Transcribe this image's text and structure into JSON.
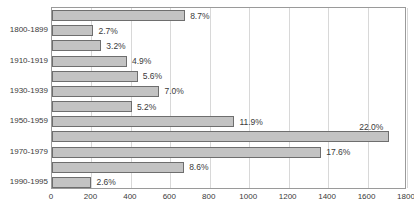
{
  "chart_data": {
    "type": "bar",
    "orientation": "horizontal",
    "title": "",
    "xlabel": "",
    "ylabel": "",
    "xlim": [
      0,
      1800
    ],
    "xticks": [
      0,
      200,
      400,
      600,
      800,
      1000,
      1200,
      1400,
      1600,
      1800
    ],
    "grid": true,
    "legend": null,
    "colors": {
      "bar_fill": "#c3c3c3",
      "bar_border": "#6e6e6e",
      "gridline": "#d8d8d8",
      "frame": "#9a9a9a",
      "text": "#3a3a3a"
    },
    "categories": [
      "",
      "1800-1899",
      "",
      "1910-1919",
      "",
      "1930-1939",
      "",
      "1950-1959",
      "",
      "1970-1979",
      "",
      "1990-1995"
    ],
    "category_labels": [
      "1800-1899",
      "1910-1919",
      "1930-1939",
      "1950-1959",
      "1970-1979",
      "1990-1995"
    ],
    "bars": [
      {
        "value": 675,
        "label": "8.7%",
        "label_position": "right"
      },
      {
        "value": 210,
        "label": "2.7%",
        "label_position": "right"
      },
      {
        "value": 250,
        "label": "3.2%",
        "label_position": "right"
      },
      {
        "value": 380,
        "label": "4.9%",
        "label_position": "right"
      },
      {
        "value": 435,
        "label": "5.6%",
        "label_position": "right"
      },
      {
        "value": 545,
        "label": "7.0%",
        "label_position": "right"
      },
      {
        "value": 405,
        "label": "5.2%",
        "label_position": "right"
      },
      {
        "value": 925,
        "label": "11.9%",
        "label_position": "right"
      },
      {
        "value": 1710,
        "label": "22.0%",
        "label_position": "above"
      },
      {
        "value": 1365,
        "label": "17.6%",
        "label_position": "right"
      },
      {
        "value": 670,
        "label": "8.6%",
        "label_position": "right"
      },
      {
        "value": 200,
        "label": "2.6%",
        "label_position": "right"
      }
    ],
    "values": [
      675,
      210,
      250,
      380,
      435,
      545,
      405,
      925,
      1710,
      1365,
      670,
      200
    ],
    "data_labels": [
      "8.7%",
      "2.7%",
      "3.2%",
      "4.9%",
      "5.6%",
      "7.0%",
      "5.2%",
      "11.9%",
      "22.0%",
      "17.6%",
      "8.6%",
      "2.6%"
    ]
  }
}
